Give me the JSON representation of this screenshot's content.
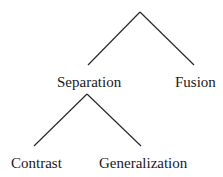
{
  "diagram": {
    "type": "tree",
    "line_color": "#2a2a2a",
    "nodes": {
      "root": {
        "label": ""
      },
      "separation": {
        "label": "Separation"
      },
      "fusion": {
        "label": "Fusion"
      },
      "contrast": {
        "label": "Contrast"
      },
      "generalization": {
        "label": "Generalization"
      }
    },
    "edges": [
      {
        "from": "root",
        "to": "separation"
      },
      {
        "from": "root",
        "to": "fusion"
      },
      {
        "from": "separation",
        "to": "contrast"
      },
      {
        "from": "separation",
        "to": "generalization"
      }
    ]
  }
}
